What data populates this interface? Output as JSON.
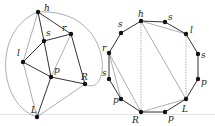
{
  "figure": {
    "left_graph": {
      "nodes": [
        {
          "id": "h",
          "label": "h",
          "x": 38,
          "y": 12,
          "lx": 44,
          "ly": 11
        },
        {
          "id": "s",
          "label": "s",
          "x": 44,
          "y": 41,
          "lx": 46,
          "ly": 36
        },
        {
          "id": "r",
          "label": "r",
          "x": 71,
          "y": 34,
          "lx": 62,
          "ly": 31
        },
        {
          "id": "l",
          "label": "l",
          "x": 23,
          "y": 62,
          "lx": 17,
          "ly": 56
        },
        {
          "id": "p",
          "label": "p",
          "x": 51,
          "y": 77,
          "lx": 54,
          "ly": 73
        },
        {
          "id": "R",
          "label": "R",
          "x": 85,
          "y": 84,
          "lx": 81,
          "ly": 80
        },
        {
          "id": "L",
          "label": "L",
          "x": 37,
          "y": 117,
          "lx": 31,
          "ly": 113
        }
      ],
      "edges_dark": [
        [
          "h",
          "s"
        ],
        [
          "s",
          "r"
        ],
        [
          "s",
          "l"
        ],
        [
          "s",
          "p"
        ],
        [
          "l",
          "p"
        ],
        [
          "p",
          "R"
        ],
        [
          "p",
          "L"
        ],
        [
          "r",
          "R"
        ],
        [
          "h",
          "r"
        ]
      ],
      "edges_light": [
        [
          "h",
          "l"
        ],
        [
          "l",
          "L"
        ],
        [
          "L",
          "R"
        ],
        [
          "r",
          "p"
        ]
      ],
      "outer_curves": [
        "left",
        "right"
      ]
    },
    "right_graph": {
      "nodes": [
        {
          "id": "h",
          "label": "h",
          "x": 141,
          "y": 21,
          "lx": 138,
          "ly": 17
        },
        {
          "id": "s1",
          "label": "s",
          "x": 165,
          "y": 22,
          "lx": 168,
          "ly": 20
        },
        {
          "id": "l",
          "label": "l",
          "x": 186,
          "y": 34,
          "lx": 190,
          "ly": 33
        },
        {
          "id": "s2",
          "label": "s",
          "x": 198,
          "y": 54,
          "lx": 201,
          "ly": 58
        },
        {
          "id": "p1",
          "label": "p",
          "x": 198,
          "y": 79,
          "lx": 201,
          "ly": 85
        },
        {
          "id": "L",
          "label": "L",
          "x": 186,
          "y": 99,
          "lx": 182,
          "ly": 112
        },
        {
          "id": "p2",
          "label": "p",
          "x": 165,
          "y": 112,
          "lx": 168,
          "ly": 121
        },
        {
          "id": "R",
          "label": "R",
          "x": 141,
          "y": 112,
          "lx": 132,
          "ly": 123
        },
        {
          "id": "p3",
          "label": "p",
          "x": 121,
          "y": 99,
          "lx": 113,
          "ly": 103
        },
        {
          "id": "s3",
          "label": "s",
          "x": 109,
          "y": 79,
          "lx": 102,
          "ly": 76
        },
        {
          "id": "r",
          "label": "r",
          "x": 109,
          "y": 53,
          "lx": 102,
          "ly": 51
        },
        {
          "id": "s4",
          "label": "s",
          "x": 121,
          "y": 33,
          "lx": 118,
          "ly": 27
        }
      ],
      "cycle_order": [
        "h",
        "s1",
        "l",
        "s2",
        "p1",
        "L",
        "p2",
        "R",
        "p3",
        "s3",
        "r",
        "s4"
      ],
      "chords_light": [
        [
          "h",
          "l"
        ],
        [
          "h",
          "L"
        ],
        [
          "R",
          "L"
        ],
        [
          "r",
          "R"
        ],
        [
          "r",
          "p3"
        ]
      ],
      "chords_dashed": [
        [
          "h",
          "R"
        ],
        [
          "l",
          "L"
        ]
      ]
    }
  }
}
